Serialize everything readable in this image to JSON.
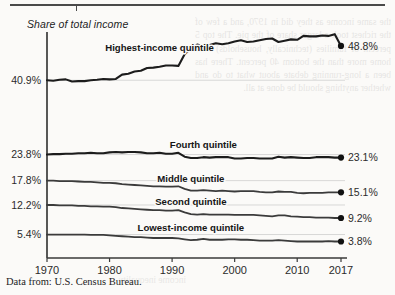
{
  "figure": {
    "axis_title": "Share of total income",
    "source_note": "Data from: U.S. Census Bureau.",
    "background_bleed_text": "the same income as they did in 1970, and a few of the richest took a larger share of the pie. The top 5 percent of families (technically, households) took home more than the bottom 40 percent. There has been a long-running debate about what to do and whether anything should be done at all.",
    "background_bleed_text2": "income inequality"
  },
  "chart_data": {
    "type": "line",
    "title": "Share of total income",
    "xlabel": "",
    "ylabel": "Share of total income",
    "xlim": [
      1970,
      2017
    ],
    "ylim": [
      0,
      52
    ],
    "grid": false,
    "legend": "inline-labels",
    "xticks": [
      1970,
      1980,
      1990,
      2000,
      2010,
      2017
    ],
    "xtick_labels": [
      "1970",
      "1980",
      "1990",
      "2000",
      "2010",
      "2017"
    ],
    "ytick_labels_left": [
      "40.9%",
      "23.8%",
      "17.8%",
      "12.2%",
      "5.4%"
    ],
    "ytick_values_left": [
      40.9,
      23.8,
      17.8,
      12.2,
      5.4
    ],
    "end_labels_right": [
      "48.8%",
      "23.1%",
      "15.1%",
      "9.2%",
      "3.8%"
    ],
    "end_values_right": [
      48.8,
      23.1,
      15.1,
      9.2,
      3.8
    ],
    "x": [
      1970,
      1971,
      1972,
      1973,
      1974,
      1975,
      1976,
      1977,
      1978,
      1979,
      1980,
      1981,
      1982,
      1983,
      1984,
      1985,
      1986,
      1987,
      1988,
      1989,
      1990,
      1991,
      1992,
      1993,
      1994,
      1995,
      1996,
      1997,
      1998,
      1999,
      2000,
      2001,
      2002,
      2003,
      2004,
      2005,
      2006,
      2007,
      2008,
      2009,
      2010,
      2011,
      2012,
      2013,
      2014,
      2015,
      2016,
      2017
    ],
    "series": [
      {
        "name": "Highest-income quintile",
        "label": "Highest-income quintile",
        "start_value": 40.9,
        "end_value": 48.8,
        "values": [
          40.9,
          40.8,
          41.0,
          41.1,
          40.6,
          40.7,
          40.7,
          40.9,
          41.0,
          41.2,
          41.1,
          41.2,
          42.2,
          42.4,
          42.9,
          43.1,
          43.7,
          43.8,
          44.0,
          44.3,
          44.3,
          44.2,
          46.9,
          48.2,
          49.1,
          48.7,
          49.0,
          49.4,
          49.2,
          49.4,
          49.8,
          50.1,
          49.7,
          49.8,
          50.1,
          50.4,
          50.5,
          49.7,
          50.0,
          50.3,
          50.2,
          51.1,
          51.0,
          51.0,
          51.2,
          51.1,
          51.5,
          48.8
        ]
      },
      {
        "name": "Fourth quintile",
        "label": "Fourth quintile",
        "start_value": 23.8,
        "end_value": 23.1,
        "values": [
          23.8,
          23.9,
          23.9,
          24.0,
          24.0,
          24.1,
          24.1,
          24.2,
          24.1,
          24.1,
          24.3,
          24.4,
          24.3,
          24.4,
          24.4,
          24.3,
          24.1,
          24.1,
          24.2,
          24.0,
          24.0,
          24.2,
          23.3,
          23.0,
          23.0,
          23.2,
          23.1,
          23.2,
          23.2,
          23.2,
          22.9,
          22.9,
          23.0,
          23.0,
          22.9,
          22.9,
          22.9,
          23.3,
          23.1,
          23.2,
          23.1,
          23.0,
          23.0,
          23.2,
          23.2,
          23.2,
          23.1,
          23.1
        ]
      },
      {
        "name": "Middle quintile",
        "label": "Middle quintile",
        "start_value": 17.8,
        "end_value": 15.1,
        "values": [
          17.8,
          17.8,
          17.7,
          17.7,
          17.7,
          17.6,
          17.5,
          17.5,
          17.4,
          17.3,
          17.3,
          17.2,
          17.0,
          16.9,
          16.8,
          16.7,
          16.6,
          16.5,
          16.5,
          16.4,
          16.4,
          16.5,
          15.9,
          15.5,
          15.5,
          15.6,
          15.5,
          15.4,
          15.5,
          15.4,
          15.3,
          15.4,
          15.4,
          15.4,
          15.2,
          15.1,
          15.1,
          15.3,
          15.2,
          15.2,
          15.0,
          14.9,
          15.0,
          15.0,
          15.0,
          15.1,
          15.1,
          15.1
        ]
      },
      {
        "name": "Second quintile",
        "label": "Second quintile",
        "start_value": 12.2,
        "end_value": 9.2,
        "values": [
          12.2,
          12.2,
          12.1,
          12.1,
          12.1,
          12.0,
          12.0,
          11.9,
          11.9,
          11.8,
          11.8,
          11.7,
          11.5,
          11.4,
          11.3,
          11.2,
          11.1,
          11.0,
          11.0,
          10.9,
          10.9,
          11.0,
          10.5,
          10.1,
          10.0,
          10.1,
          10.0,
          10.0,
          10.0,
          10.0,
          9.9,
          9.9,
          9.9,
          9.9,
          9.8,
          9.7,
          9.6,
          9.8,
          9.8,
          9.6,
          9.5,
          9.4,
          9.4,
          9.3,
          9.3,
          9.3,
          9.2,
          9.2
        ]
      },
      {
        "name": "Lowest-income quintile",
        "label": "Lowest-income quintile",
        "start_value": 5.4,
        "end_value": 3.8,
        "values": [
          5.4,
          5.4,
          5.4,
          5.4,
          5.4,
          5.4,
          5.4,
          5.3,
          5.3,
          5.3,
          5.2,
          5.1,
          5.0,
          4.9,
          4.8,
          4.8,
          4.7,
          4.6,
          4.6,
          4.6,
          4.6,
          4.5,
          4.3,
          4.1,
          4.2,
          4.4,
          4.2,
          4.2,
          4.2,
          4.3,
          4.3,
          4.2,
          4.2,
          4.1,
          4.0,
          4.0,
          4.0,
          4.1,
          4.0,
          3.9,
          3.8,
          3.8,
          3.8,
          3.8,
          3.8,
          3.9,
          3.8,
          3.8
        ]
      }
    ]
  }
}
